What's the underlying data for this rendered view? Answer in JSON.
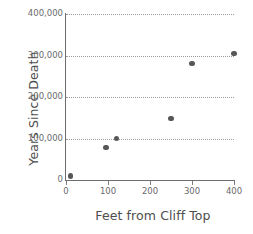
{
  "chart_data": {
    "type": "scatter",
    "title": "",
    "xlabel": "Feet from Cliff Top",
    "ylabel": "Years Since Death",
    "xlim": [
      0,
      400
    ],
    "ylim": [
      0,
      400000
    ],
    "grid": true,
    "legend": null,
    "marker_color": "#575757",
    "axis_color": "#6e6e6e",
    "gridline_color": "#9a9a9a",
    "xticks": [
      0,
      100,
      200,
      300,
      400
    ],
    "xtick_labels": [
      "0",
      "100",
      "200",
      "300",
      "400"
    ],
    "yticks": [
      0,
      100000,
      200000,
      300000,
      400000
    ],
    "ytick_labels": [
      "0",
      "100,000",
      "200,000",
      "300,000",
      "400,000"
    ],
    "gridline_values": [
      100000,
      200000,
      300000,
      400000
    ],
    "x": [
      10,
      95,
      120,
      250,
      300,
      400
    ],
    "y": [
      10000,
      78000,
      100000,
      148000,
      281000,
      305000
    ],
    "points": [
      {
        "x": 10,
        "y": 10000
      },
      {
        "x": 95,
        "y": 78000
      },
      {
        "x": 120,
        "y": 100000
      },
      {
        "x": 250,
        "y": 148000
      },
      {
        "x": 300,
        "y": 281000
      },
      {
        "x": 400,
        "y": 305000
      }
    ]
  }
}
